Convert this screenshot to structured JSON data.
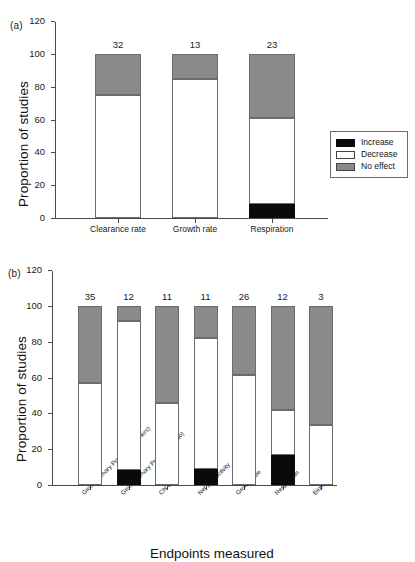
{
  "figure": {
    "panel_a_tag": "(a)",
    "panel_b_tag": "(b)"
  },
  "legend": {
    "position": "right-middle",
    "items": [
      {
        "key": "increase",
        "label": "Increase",
        "color": "#000000"
      },
      {
        "key": "decrease",
        "label": "Decrease",
        "color": "#ffffff"
      },
      {
        "key": "noeffect",
        "label": "No effect",
        "color": "#8a8a8a"
      }
    ]
  },
  "chart_data": [
    {
      "id": "panel-a",
      "type": "bar",
      "subtype": "stacked-100-percent",
      "title": "(a)",
      "xlabel": "",
      "ylabel": "Proportion of studies",
      "ylim": [
        0,
        120
      ],
      "yticks": [
        0,
        20,
        40,
        60,
        80,
        100,
        120
      ],
      "grid": false,
      "legend_position": "right",
      "categories": [
        "Clearance rate",
        "Growth rate",
        "Respiration"
      ],
      "n_labels": [
        "32",
        "13",
        "23"
      ],
      "n_values": [
        32,
        13,
        23
      ],
      "series": [
        {
          "name": "Increase",
          "color": "#000000",
          "values": [
            0,
            0,
            8.7
          ]
        },
        {
          "name": "Decrease",
          "color": "#ffffff",
          "values": [
            75,
            84.6,
            52.3
          ]
        },
        {
          "name": "No effect",
          "color": "#8a8a8a",
          "values": [
            25,
            15.4,
            39.0
          ]
        }
      ]
    },
    {
      "id": "panel-b",
      "type": "bar",
      "subtype": "stacked-100-percent",
      "title": "(b)",
      "xlabel": "Endpoints measured",
      "ylabel": "Proportion of studies",
      "ylim": [
        0,
        120
      ],
      "yticks": [
        0,
        20,
        40,
        60,
        80,
        100,
        120
      ],
      "grid": false,
      "legend_position": "none",
      "categories": [
        "Gross Primary Production (others)",
        "Gross Primary Production (fluo)",
        "Chl a",
        "Net productivity",
        "Growth rate",
        "Respiration",
        "Biomass"
      ],
      "n_labels": [
        "35",
        "12",
        "11",
        "11",
        "26",
        "12",
        "3"
      ],
      "n_values": [
        35,
        12,
        11,
        11,
        26,
        12,
        3
      ],
      "series": [
        {
          "name": "Increase",
          "color": "#000000",
          "values": [
            0,
            8.3,
            0,
            9.1,
            0,
            16.7,
            0
          ]
        },
        {
          "name": "Decrease",
          "color": "#ffffff",
          "values": [
            57.0,
            83.3,
            45.5,
            72.7,
            61.5,
            25.0,
            33.3
          ]
        },
        {
          "name": "No effect",
          "color": "#8a8a8a",
          "values": [
            43.0,
            8.4,
            54.5,
            18.2,
            38.5,
            58.3,
            66.7
          ]
        }
      ]
    }
  ]
}
